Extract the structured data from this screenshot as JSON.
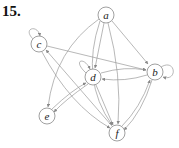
{
  "problem_label": "15.",
  "graph": {
    "type": "directed",
    "nodes": [
      {
        "id": "a",
        "label": "a",
        "x": 106,
        "y": 15
      },
      {
        "id": "b",
        "label": "b",
        "x": 155,
        "y": 72
      },
      {
        "id": "c",
        "label": "c",
        "x": 39,
        "y": 44
      },
      {
        "id": "d",
        "label": "d",
        "x": 93,
        "y": 77
      },
      {
        "id": "e",
        "label": "e",
        "x": 47,
        "y": 116
      },
      {
        "id": "f",
        "label": "f",
        "x": 117,
        "y": 133
      }
    ],
    "edges": [
      {
        "from": "a",
        "to": "b"
      },
      {
        "from": "a",
        "to": "d"
      },
      {
        "from": "a",
        "to": "e"
      },
      {
        "from": "a",
        "to": "f"
      },
      {
        "from": "b",
        "to": "b"
      },
      {
        "from": "b",
        "to": "d"
      },
      {
        "from": "b",
        "to": "f"
      },
      {
        "from": "c",
        "to": "c"
      },
      {
        "from": "c",
        "to": "b"
      },
      {
        "from": "c",
        "to": "f"
      },
      {
        "from": "d",
        "to": "d"
      },
      {
        "from": "d",
        "to": "b"
      },
      {
        "from": "d",
        "to": "e"
      },
      {
        "from": "d",
        "to": "f"
      },
      {
        "from": "e",
        "to": "d"
      },
      {
        "from": "f",
        "to": "b"
      },
      {
        "from": "f",
        "to": "c"
      }
    ]
  }
}
